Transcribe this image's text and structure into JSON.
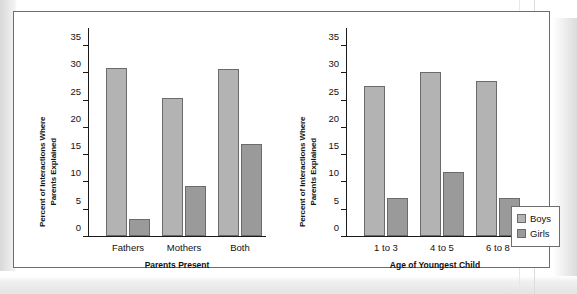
{
  "figure": {
    "legend": {
      "position": "right-outside",
      "entries": [
        {
          "label": "Boys",
          "color": "#b3b3b3"
        },
        {
          "label": "Girls",
          "color": "#9a9a9a"
        }
      ]
    }
  },
  "chart_data": [
    {
      "type": "bar",
      "panel": "left",
      "title": "",
      "xlabel": "Parents Present",
      "ylabel": "Percent of Interactions Where Parents Explained",
      "ylabel_line1": "Percent of Interactions Where",
      "ylabel_line2": "Parents Explained",
      "categories": [
        "Fathers",
        "Mothers",
        "Both"
      ],
      "yticks": [
        0,
        5,
        10,
        15,
        20,
        25,
        30,
        35
      ],
      "ytick_labels": [
        "0",
        "5",
        "10",
        "15",
        "20",
        "25",
        "30",
        "35"
      ],
      "ylim": [
        0,
        35
      ],
      "grid": false,
      "series": [
        {
          "name": "Boys",
          "color": "#b3b3b3",
          "values": [
            30.7,
            25.2,
            30.6
          ]
        },
        {
          "name": "Girls",
          "color": "#9a9a9a",
          "values": [
            3.2,
            9.2,
            16.8
          ]
        }
      ]
    },
    {
      "type": "bar",
      "panel": "right",
      "title": "",
      "xlabel": "Age of Youngest Child",
      "ylabel": "Percent of Interactions Where Parents Explained",
      "ylabel_line1": "Percent of Interactions Where",
      "ylabel_line2": "Parents Explained",
      "categories": [
        "1 to 3",
        "4 to 5",
        "6 to 8"
      ],
      "yticks": [
        0,
        5,
        10,
        15,
        20,
        25,
        30,
        35
      ],
      "ytick_labels": [
        "0",
        "5",
        "10",
        "15",
        "20",
        "25",
        "30",
        "35"
      ],
      "ylim": [
        0,
        35
      ],
      "grid": false,
      "series": [
        {
          "name": "Boys",
          "color": "#b3b3b3",
          "values": [
            27.4,
            30.0,
            28.4
          ]
        },
        {
          "name": "Girls",
          "color": "#9a9a9a",
          "values": [
            7.0,
            11.8,
            7.0
          ]
        }
      ]
    }
  ]
}
